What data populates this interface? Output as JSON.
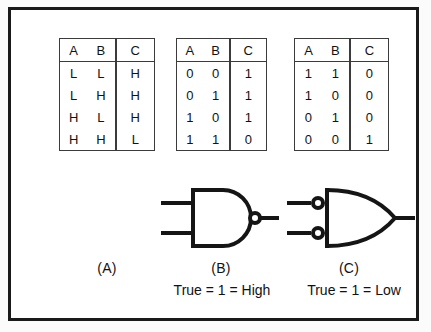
{
  "figure": {
    "background_color": "#ffffff",
    "frame_color": "#1a1a1a",
    "ink_color": "#121212"
  },
  "tables": [
    {
      "id": "A",
      "headers": [
        "A",
        "B",
        "C"
      ],
      "rows": [
        [
          "L",
          "L",
          "H"
        ],
        [
          "L",
          "H",
          "H"
        ],
        [
          "H",
          "L",
          "H"
        ],
        [
          "H",
          "H",
          "L"
        ]
      ]
    },
    {
      "id": "B",
      "headers": [
        "A",
        "B",
        "C"
      ],
      "rows": [
        [
          "0",
          "0",
          "1"
        ],
        [
          "0",
          "1",
          "1"
        ],
        [
          "1",
          "0",
          "1"
        ],
        [
          "1",
          "1",
          "0"
        ]
      ]
    },
    {
      "id": "C",
      "headers": [
        "A",
        "B",
        "C"
      ],
      "rows": [
        [
          "1",
          "1",
          "0"
        ],
        [
          "1",
          "0",
          "0"
        ],
        [
          "0",
          "1",
          "0"
        ],
        [
          "0",
          "0",
          "1"
        ]
      ]
    }
  ],
  "gates": [
    {
      "name": "nand-gate",
      "shape": "and-body-with-output-bubble",
      "inputs": 2,
      "input_bubbles": false,
      "output_bubble": true
    },
    {
      "name": "negative-or-gate",
      "shape": "or-body-with-input-bubbles",
      "inputs": 2,
      "input_bubbles": true,
      "output_bubble": false
    }
  ],
  "captions": {
    "a": "(A)",
    "b": "(B)",
    "c": "(C)"
  },
  "sub_captions": {
    "b": "True = 1 = High",
    "c": "True = 1 = Low"
  }
}
